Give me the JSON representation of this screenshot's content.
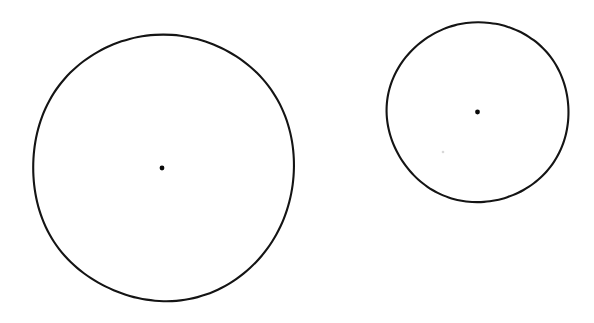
{
  "figure": {
    "background_color": "#ffffff",
    "ink_color": "#141414",
    "width": 594,
    "height": 323,
    "caption": "",
    "style": "hand-drawn scanned line art",
    "shape_count": 2
  },
  "chart_data": {
    "type": "scatter",
    "xlabel": "",
    "ylabel": "",
    "xlim": [
      0,
      594
    ],
    "ylim": [
      0,
      323
    ],
    "grid": false,
    "legend": "none",
    "units": "pixels",
    "annotations": [],
    "shapes": [
      {
        "name": "large-circle",
        "role": "outline",
        "geometry": "circle",
        "cx": 163.5,
        "cy": 167.5,
        "rx": 131,
        "ry": 133.5,
        "diameter": 264,
        "stroke_width": 2.1,
        "stroke_color": "#141414",
        "fill": "none",
        "bbox": [
          32,
          34,
          295,
          301
        ],
        "label": ""
      },
      {
        "name": "small-circle",
        "role": "outline",
        "geometry": "circle",
        "cx": 478,
        "cy": 112,
        "rx": 91,
        "ry": 90,
        "diameter": 181,
        "stroke_width": 2.1,
        "stroke_color": "#141414",
        "fill": "none",
        "bbox": [
          387,
          22,
          569,
          202
        ],
        "label": ""
      }
    ],
    "points": [
      {
        "name": "large-circle-center-dot",
        "x": 162,
        "y": 168,
        "radius": 2.4,
        "color": "#0a0a0a",
        "label": ""
      },
      {
        "name": "small-circle-center-dot",
        "x": 477.5,
        "y": 112,
        "radius": 2.4,
        "color": "#0a0a0a",
        "label": ""
      },
      {
        "name": "faint-speck",
        "x": 443,
        "y": 152,
        "radius": 1.3,
        "color": "#d8d8d8",
        "label": ""
      }
    ]
  }
}
